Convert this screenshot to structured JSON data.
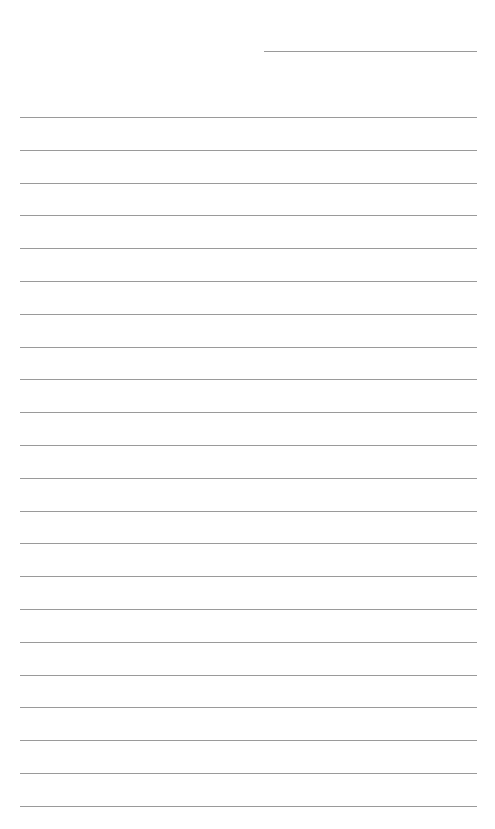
{
  "page": {
    "type": "lined-paper",
    "background_color": "#ffffff",
    "line_color": "#9a9a9a",
    "header_line": {
      "x1": 264,
      "x2": 477,
      "y": 51
    },
    "ruled_lines": {
      "x1": 20,
      "x2": 477,
      "first_y": 117,
      "spacing": 32.8,
      "count": 22
    }
  }
}
